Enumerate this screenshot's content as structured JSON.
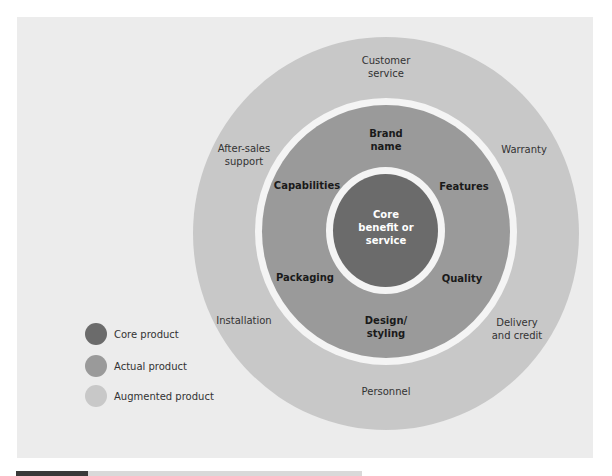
{
  "colors": {
    "core": "#6b6b6b",
    "actual": "#9a9a9a",
    "augmented": "#c8c8c8",
    "background": "#ececec"
  },
  "diagram": {
    "core": {
      "label": "Core benefit or service",
      "lines": [
        "Core",
        "benefit or",
        "service"
      ]
    },
    "actual": {
      "items": [
        {
          "id": "brand-name",
          "lines": [
            "Brand",
            "name"
          ]
        },
        {
          "id": "capabilities",
          "lines": [
            "Capabilities"
          ]
        },
        {
          "id": "features",
          "lines": [
            "Features"
          ]
        },
        {
          "id": "packaging",
          "lines": [
            "Packaging"
          ]
        },
        {
          "id": "quality",
          "lines": [
            "Quality"
          ]
        },
        {
          "id": "design-styling",
          "lines": [
            "Design/",
            "styling"
          ]
        }
      ]
    },
    "augmented": {
      "items": [
        {
          "id": "customer-service",
          "lines": [
            "Customer",
            "service"
          ]
        },
        {
          "id": "after-sales-support",
          "lines": [
            "After-sales",
            "support"
          ]
        },
        {
          "id": "warranty",
          "lines": [
            "Warranty"
          ]
        },
        {
          "id": "installation",
          "lines": [
            "Installation"
          ]
        },
        {
          "id": "delivery-and-credit",
          "lines": [
            "Delivery",
            "and credit"
          ]
        },
        {
          "id": "personnel",
          "lines": [
            "Personnel"
          ]
        }
      ]
    }
  },
  "legend": [
    {
      "label": "Core product",
      "color": "#6b6b6b"
    },
    {
      "label": "Actual product",
      "color": "#9a9a9a"
    },
    {
      "label": "Augmented product",
      "color": "#c8c8c8"
    }
  ]
}
